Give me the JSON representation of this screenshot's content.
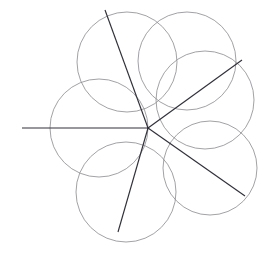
{
  "figure": {
    "canvas": {
      "width": 271,
      "height": 258,
      "background": "#ffffff"
    },
    "common_point": {
      "x": 148,
      "y": 128,
      "label": "common-intersection-point"
    },
    "colors": {
      "circle_stroke": "#8a8a8f",
      "ray_stroke": "#30303a",
      "background": "#ffffff"
    },
    "stroke_widths": {
      "circle": 0.8,
      "ray": 1.15
    },
    "circle_radius": 49,
    "circles": [
      {
        "name": "circle-left",
        "cx": 99,
        "cy": 128,
        "r": 49,
        "direction_deg": 180
      },
      {
        "name": "circle-upper-left",
        "cx": 127,
        "cy": 62,
        "r": 50,
        "direction_deg": 113
      },
      {
        "name": "circle-top-right",
        "cx": 187,
        "cy": 61,
        "r": 49,
        "direction_deg": 60
      },
      {
        "name": "circle-right",
        "cx": 205,
        "cy": 100,
        "r": 49,
        "direction_deg": 35
      },
      {
        "name": "circle-lower-right",
        "cx": 210,
        "cy": 168,
        "r": 47,
        "direction_deg": -36
      },
      {
        "name": "circle-bottom",
        "cx": 126,
        "cy": 192,
        "r": 50,
        "direction_deg": -106
      }
    ],
    "rays": [
      {
        "name": "ray-left",
        "x1": 148,
        "y1": 128,
        "x2": 22,
        "y2": 128,
        "angle_deg": 180
      },
      {
        "name": "ray-upper-left",
        "x1": 148,
        "y1": 128,
        "x2": 105,
        "y2": 10,
        "angle_deg": 110
      },
      {
        "name": "ray-upper-right",
        "x1": 148,
        "y1": 128,
        "x2": 242,
        "y2": 60,
        "angle_deg": 36
      },
      {
        "name": "ray-lower-right",
        "x1": 148,
        "y1": 128,
        "x2": 245,
        "y2": 196,
        "angle_deg": -35
      },
      {
        "name": "ray-bottom",
        "x1": 148,
        "y1": 128,
        "x2": 118,
        "y2": 232,
        "angle_deg": -106
      }
    ]
  }
}
